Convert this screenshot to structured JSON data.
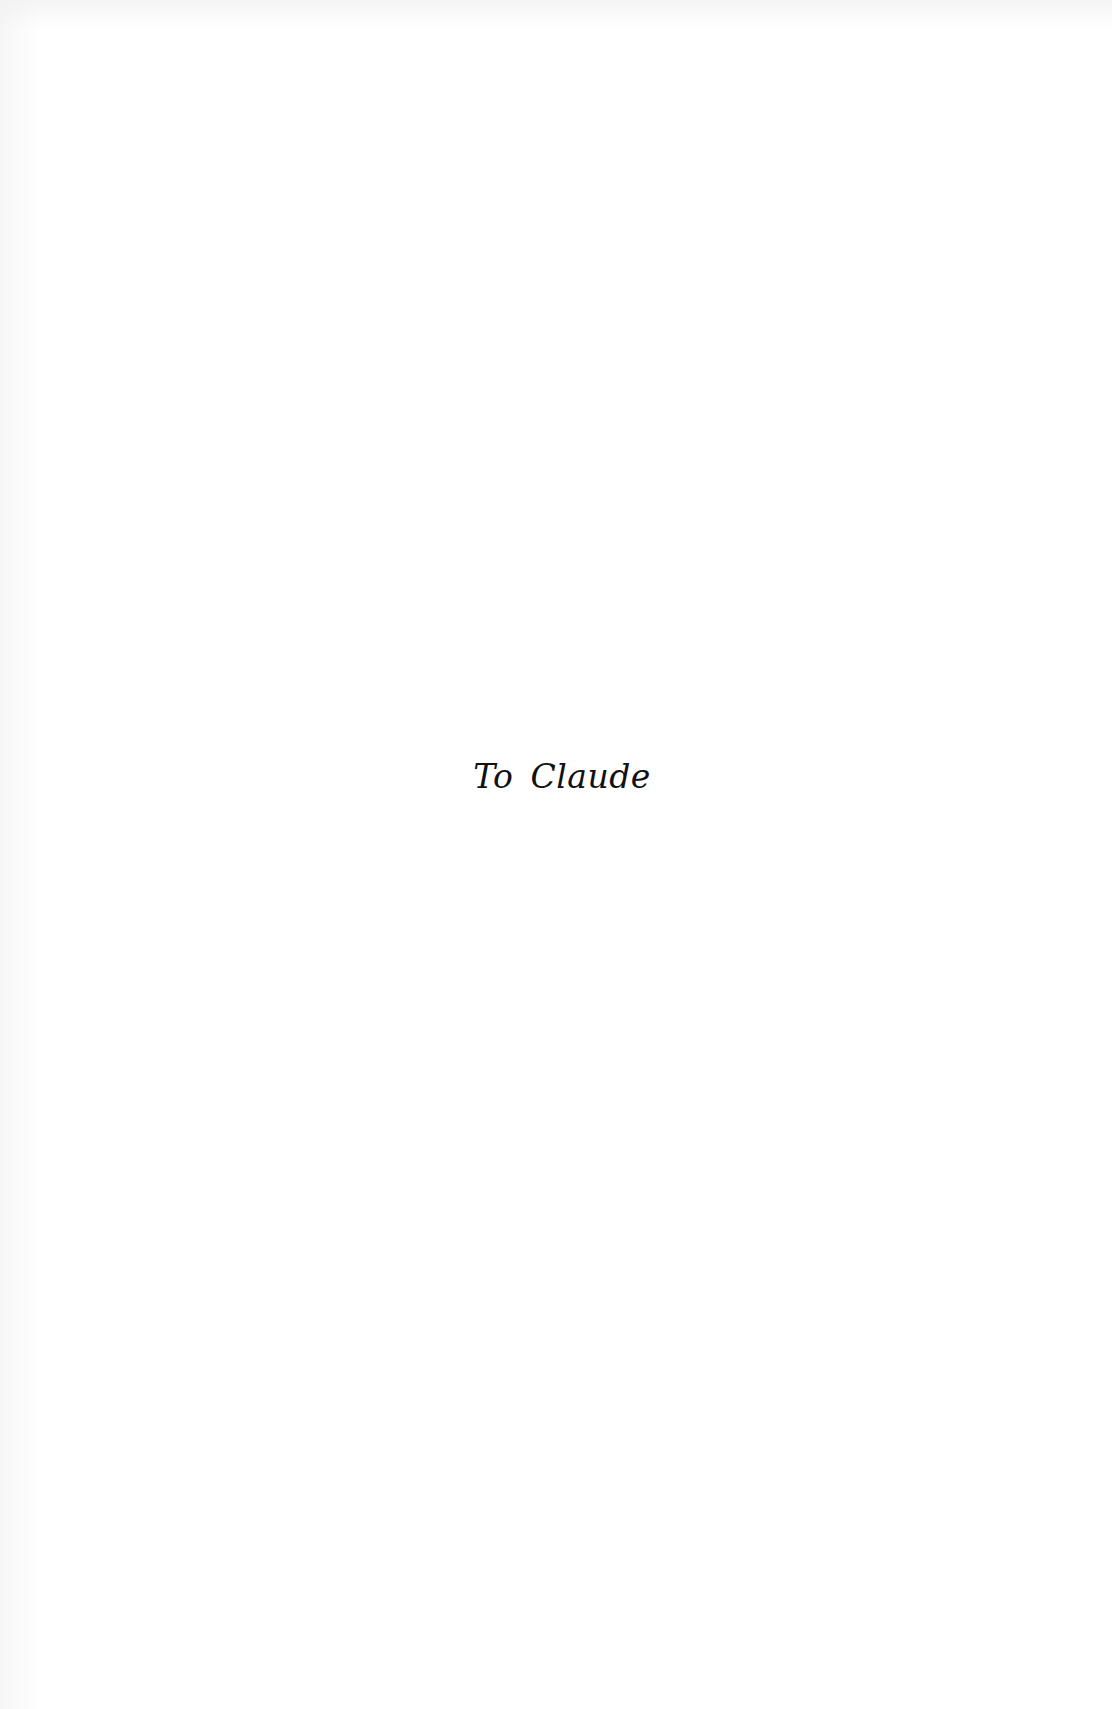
{
  "page": {
    "type": "dedication-page",
    "background_color": "#ffffff",
    "text_color": "#111111"
  },
  "dedication": {
    "text": "To Claude"
  }
}
